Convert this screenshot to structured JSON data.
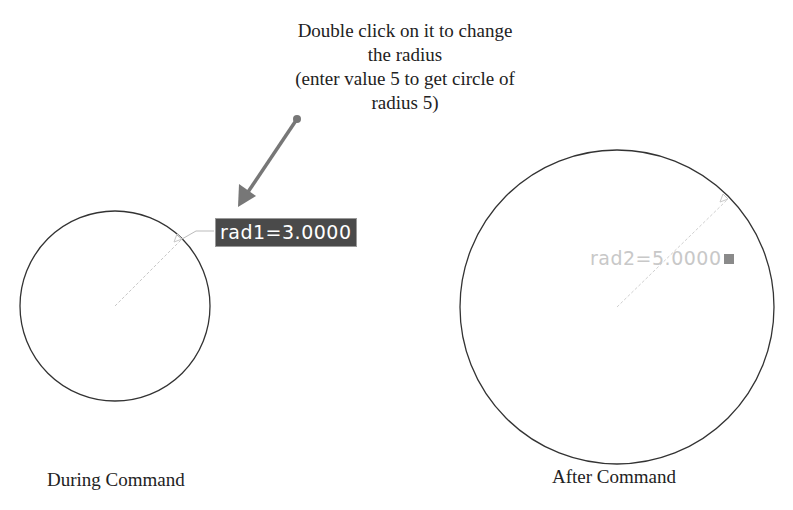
{
  "annotation": {
    "lines": [
      "Double click on it to change",
      "the radius",
      "(enter value 5 to get circle of",
      "radius 5)"
    ],
    "arrow_color": "#777777"
  },
  "left_panel": {
    "caption": "During Command",
    "dimension_label": "rad1=3.0000",
    "dimension_label_bg": "#4a4a4a",
    "circle": {
      "cx": 115,
      "cy": 306,
      "r": 95
    }
  },
  "right_panel": {
    "caption": "After Command",
    "dimension_label": "rad2=5.0000",
    "lock_icon": "lock-icon",
    "circle": {
      "cx": 617,
      "cy": 307,
      "r": 157
    }
  }
}
